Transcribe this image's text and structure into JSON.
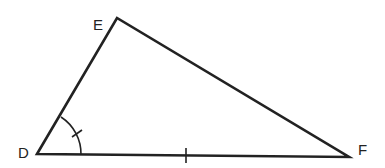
{
  "diagram": {
    "type": "triangle",
    "vertices": [
      {
        "name": "D",
        "label": "D"
      },
      {
        "name": "E",
        "label": "E"
      },
      {
        "name": "F",
        "label": "F"
      }
    ],
    "markings": {
      "angle_D": "single arc with one tick",
      "side_DF": "single tick mark"
    },
    "stroke_color": "#222222"
  }
}
